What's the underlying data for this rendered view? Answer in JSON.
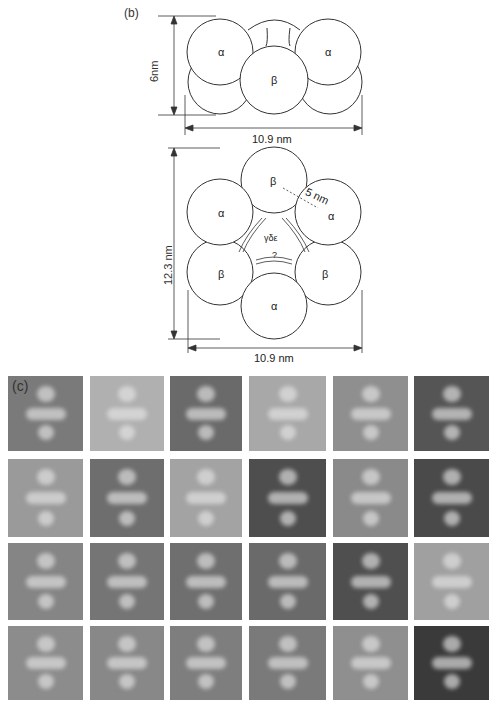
{
  "figure": {
    "panel_b": {
      "label": "(b)",
      "side_view": {
        "height_label": "6nm",
        "width_label": "10.9 nm",
        "subunits": [
          "α",
          "β",
          "α"
        ]
      },
      "top_view": {
        "height_label": "12.3 nm",
        "width_label": "10.9 nm",
        "distance_label": "5 nm",
        "subunits": [
          "β",
          "α",
          "α",
          "β",
          "β",
          "α"
        ],
        "center_label": "γδε",
        "question_label": "?"
      }
    },
    "panel_c": {
      "label": "(c)",
      "rows": 4,
      "columns": 6,
      "description": "Electron micrograph gallery of negatively stained particles"
    }
  }
}
